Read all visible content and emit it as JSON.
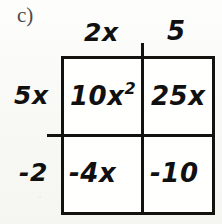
{
  "problem": {
    "label": "c)"
  },
  "model": {
    "type": "area-model-box-method",
    "column_headers": [
      "2x",
      "5"
    ],
    "row_headers": [
      "5x",
      "-2"
    ],
    "cells": [
      [
        {
          "coefficient": "10x",
          "exponent": "2",
          "full": "10x2"
        },
        {
          "coefficient": "25x",
          "exponent": "",
          "full": "25x"
        }
      ],
      [
        {
          "coefficient": "-4x",
          "exponent": "",
          "full": "-4x"
        },
        {
          "coefficient": "-10",
          "exponent": "",
          "full": "-10"
        }
      ]
    ]
  },
  "colors": {
    "ink": "#101010",
    "rule": "#14120f",
    "label_ink": "#4a4a4a",
    "paper": "#fbfbf9",
    "cell_fill": "#fffffd"
  }
}
